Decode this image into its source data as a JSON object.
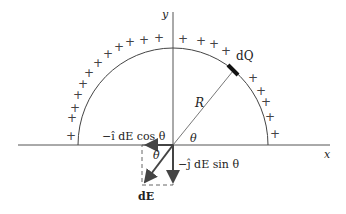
{
  "diagram": {
    "type": "physics-charged-semicircle",
    "axes": {
      "x_label": "x",
      "y_label": "y"
    },
    "charge_element_label": "dQ",
    "radius_label": "R",
    "angle_label": "θ",
    "field_label": "dE",
    "component_x_label": "−î dE cos θ",
    "component_y_label": "−ĵ dE sin θ",
    "charge_sign": "+",
    "colors": {
      "ink": "#333333",
      "arrow": "#444444",
      "background": "#ffffff"
    }
  }
}
